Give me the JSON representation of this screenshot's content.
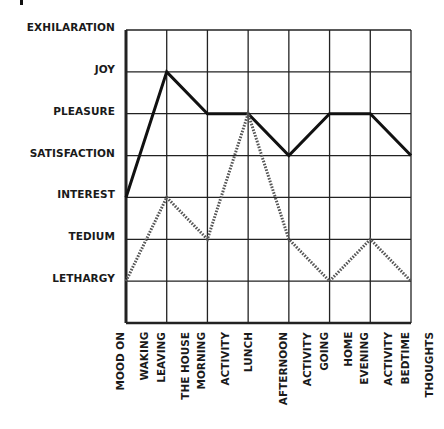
{
  "chart_data": {
    "type": "line",
    "title": "",
    "xlabel": "",
    "ylabel": "",
    "y_levels": [
      "EXHILARATION",
      "JOY",
      "PLEASURE",
      "SATISFACTION",
      "INTEREST",
      "TEDIUM",
      "LETHARGY"
    ],
    "y_level_values": {
      "EXHILARATION": 7,
      "JOY": 6,
      "PLEASURE": 5,
      "SATISFACTION": 4,
      "INTEREST": 3,
      "TEDIUM": 2,
      "LETHARGY": 1
    },
    "ylim": [
      0,
      7
    ],
    "categories": [
      [
        "MOOD ON",
        "WAKING"
      ],
      [
        "LEAVING",
        "THE HOUSE"
      ],
      [
        "MORNING",
        "ACTIVITY"
      ],
      [
        "LUNCH"
      ],
      [
        "AFTERNOON",
        "ACTIVITY"
      ],
      [
        "GOING",
        "HOME"
      ],
      [
        "EVENING",
        "ACTIVITY"
      ],
      [
        "BEDTIME",
        "THOUGHTS"
      ]
    ],
    "series": [
      {
        "name": "solid",
        "style": "solid",
        "values": [
          3,
          6,
          5,
          5,
          4,
          5,
          5,
          4
        ],
        "labels": [
          "INTEREST",
          "JOY",
          "PLEASURE",
          "PLEASURE",
          "SATISFACTION",
          "PLEASURE",
          "PLEASURE",
          "SATISFACTION"
        ]
      },
      {
        "name": "dotted",
        "style": "dotted",
        "values": [
          1,
          3,
          2,
          5,
          2,
          1,
          2,
          1
        ],
        "labels": [
          "LETHARGY",
          "INTEREST",
          "TEDIUM",
          "PLEASURE",
          "TEDIUM",
          "LETHARGY",
          "TEDIUM",
          "LETHARGY"
        ]
      }
    ],
    "grid": true,
    "legend": "none"
  },
  "colors": {
    "line": "#111111",
    "dotted": "#555555",
    "grid": "#222222",
    "background": "#ffffff"
  }
}
